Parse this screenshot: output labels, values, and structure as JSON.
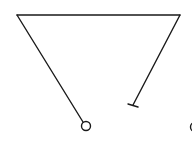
{
  "diagram": {
    "type": "line-diagram",
    "stroke_color": "#1a1a1a",
    "background": "#ffffff",
    "elements": [
      {
        "kind": "line",
        "name": "top-bar",
        "x1": 17,
        "y1": 15,
        "x2": 180,
        "y2": 15
      },
      {
        "kind": "line",
        "name": "left-arm",
        "x1": 17,
        "y1": 15,
        "x2": 83,
        "y2": 122
      },
      {
        "kind": "circle",
        "name": "left-terminal-circle",
        "cx": 86,
        "cy": 126,
        "r": 4.5
      },
      {
        "kind": "line",
        "name": "right-arm",
        "x1": 180,
        "y1": 15,
        "x2": 133,
        "y2": 105
      },
      {
        "kind": "line",
        "name": "right-terminal-tbar",
        "x1": 128,
        "y1": 104,
        "x2": 138,
        "y2": 107
      },
      {
        "kind": "circle",
        "name": "edge-partial-circle",
        "cx": 195,
        "cy": 127,
        "r": 4.5
      }
    ]
  }
}
